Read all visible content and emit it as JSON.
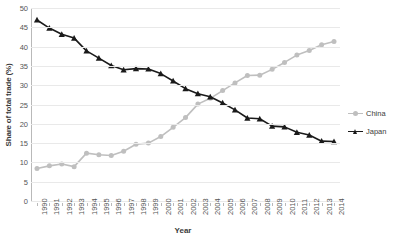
{
  "chart_data": {
    "type": "line",
    "title": "",
    "xlabel": "Year",
    "ylabel": "Share of total trade (%)",
    "x": [
      1990,
      1991,
      1992,
      1993,
      1994,
      1995,
      1996,
      1997,
      1998,
      1999,
      2000,
      2001,
      2002,
      2003,
      2004,
      2005,
      2006,
      2007,
      2008,
      2009,
      2010,
      2011,
      2012,
      2013,
      2014
    ],
    "categories": [
      "1990",
      "1991",
      "1992",
      "1993",
      "1994",
      "1995",
      "1996",
      "1997",
      "1998",
      "1999",
      "2000",
      "2001",
      "2002",
      "2003",
      "2004",
      "2005",
      "2006",
      "2007",
      "2008",
      "2009",
      "2010",
      "2011",
      "2012",
      "2013",
      "2014"
    ],
    "series": [
      {
        "name": "China",
        "color": "#bfbfbf",
        "marker": "circle",
        "values": [
          8.4,
          9.1,
          9.6,
          8.9,
          12.4,
          12.0,
          11.8,
          12.9,
          14.7,
          15.0,
          16.7,
          19.1,
          21.6,
          25.1,
          26.6,
          28.6,
          30.6,
          32.5,
          32.6,
          34.1,
          35.9,
          37.8,
          39.0,
          40.5,
          41.3
        ]
      },
      {
        "name": "Japan",
        "color": "#1a1a1a",
        "marker": "triangle",
        "values": [
          46.9,
          44.8,
          43.2,
          42.2,
          38.9,
          37.0,
          35.1,
          34.0,
          34.3,
          34.2,
          33.0,
          31.1,
          29.1,
          27.8,
          27.0,
          25.4,
          23.6,
          21.5,
          21.3,
          19.4,
          19.2,
          17.8,
          17.1,
          15.5,
          15.4
        ]
      }
    ],
    "ylim": [
      0,
      50
    ],
    "yticks": [
      0,
      5,
      10,
      15,
      20,
      25,
      30,
      35,
      40,
      45,
      50
    ],
    "grid": true,
    "grid_axis": "y",
    "legend_position": "right"
  },
  "legend": {
    "entries": [
      {
        "label": "China"
      },
      {
        "label": "Japan"
      }
    ]
  }
}
